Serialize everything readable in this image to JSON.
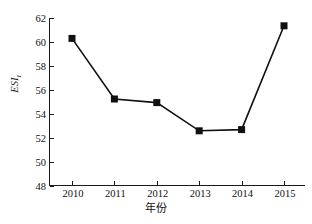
{
  "chart_data": {
    "type": "line",
    "title": "",
    "xlabel": "年份",
    "ylabel": "ESI",
    "ylabel_subscript": "I",
    "categories": [
      "2010",
      "2011",
      "2012",
      "2013",
      "2014",
      "2015"
    ],
    "values": [
      60.3,
      55.25,
      54.95,
      52.6,
      52.7,
      61.35
    ],
    "series": [
      {
        "name": "ESI",
        "values": [
          60.3,
          55.25,
          54.95,
          52.6,
          52.7,
          61.35
        ]
      }
    ],
    "ylim": [
      48,
      62
    ],
    "yticks": [
      48,
      50,
      52,
      54,
      56,
      58,
      60,
      62
    ],
    "ytick_labels": [
      "48",
      "50",
      "52",
      "54",
      "56",
      "58",
      "60",
      "62"
    ],
    "xtick_labels": [
      "2010",
      "2011",
      "2012",
      "2013",
      "2014",
      "2015"
    ],
    "grid": false,
    "legend": false,
    "legend_position": "none",
    "marker": "square",
    "marker_color": "#101010",
    "line_color": "#101010",
    "background_color": "#ffffff",
    "axis_color": "#1a1a1a"
  }
}
